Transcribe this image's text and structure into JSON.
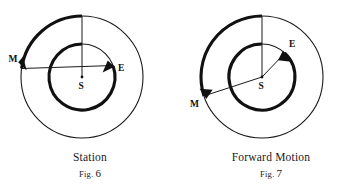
{
  "plate": {
    "background_color": "#ffffff",
    "ink_color": "#111111",
    "figure_count": 2
  },
  "figures": [
    {
      "id": "fig-6",
      "caption_title": "Station",
      "fig_abbrev": "Fig.",
      "fig_number": "6",
      "center_label": "S",
      "outer_body_label": "M",
      "inner_body_label": "E",
      "center": {
        "x": 82,
        "y": 77
      },
      "outer_radius": 61,
      "inner_radius": 33,
      "outer_body_angle_deg": 188,
      "inner_body_angle_deg": 19,
      "outer_arc_start_deg": 90,
      "outer_arc_end_deg": 188,
      "inner_arc_start_deg": 90,
      "inner_arc_end_deg": 19,
      "arc_direction": "counterclockwise",
      "sight_line": "M-S-E straight through center",
      "reference_line": "vertical radius from S to top of outer orbit"
    },
    {
      "id": "fig-7",
      "caption_title": "Forward Motion",
      "fig_abbrev": "Fig.",
      "fig_number": "7",
      "center_label": "S",
      "outer_body_label": "M",
      "inner_body_label": "E",
      "center": {
        "x": 81,
        "y": 77
      },
      "outer_radius": 61,
      "inner_radius": 33,
      "outer_body_angle_deg": 198,
      "inner_body_angle_deg": 47,
      "outer_arc_start_deg": 90,
      "outer_arc_end_deg": 198,
      "inner_arc_start_deg": 90,
      "inner_arc_end_deg": 47,
      "arc_direction": "counterclockwise",
      "sight_line": "E-S-M line through center",
      "reference_line": "vertical radius from S to top of outer orbit"
    }
  ]
}
